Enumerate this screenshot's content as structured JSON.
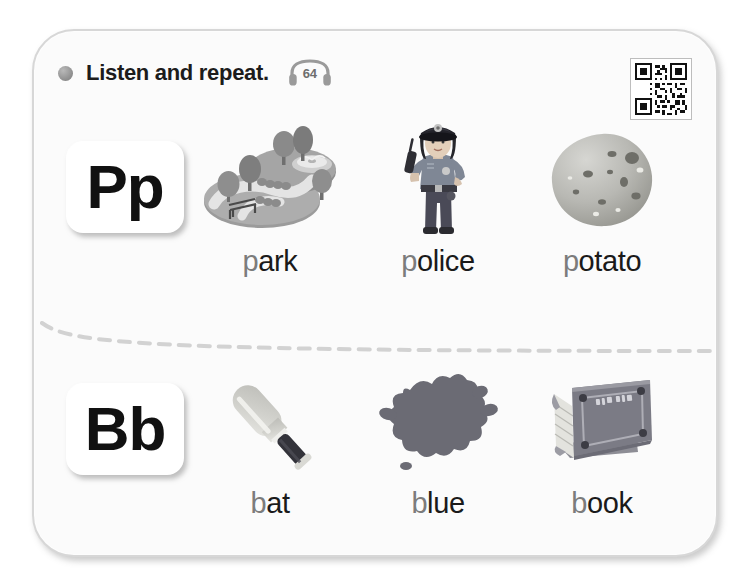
{
  "header": {
    "bullet_icon": "bullet-dot-icon",
    "title": "Listen and repeat.",
    "audio_icon": "headphones-icon",
    "audio_track": "64"
  },
  "qr": {
    "icon": "qr-code-icon"
  },
  "divider": {
    "style": "dashed-curve",
    "color": "#d2d2d2"
  },
  "rows": [
    {
      "letter": "Pp",
      "letter_card_name": "letter-card-pp",
      "items": [
        {
          "word_initial": "p",
          "word_rest": "ark",
          "word": "park",
          "art_icon": "park-illustration"
        },
        {
          "word_initial": "p",
          "word_rest": "olice",
          "word": "police",
          "art_icon": "police-officer-illustration"
        },
        {
          "word_initial": "p",
          "word_rest": "otato",
          "word": "potato",
          "art_icon": "potato-illustration"
        }
      ]
    },
    {
      "letter": "Bb",
      "letter_card_name": "letter-card-bb",
      "items": [
        {
          "word_initial": "b",
          "word_rest": "at",
          "word": "bat",
          "art_icon": "baseball-bat-illustration"
        },
        {
          "word_initial": "b",
          "word_rest": "lue",
          "word": "blue",
          "art_icon": "paint-splat-illustration"
        },
        {
          "word_initial": "b",
          "word_rest": "ook",
          "word": "book",
          "art_icon": "book-illustration"
        }
      ]
    }
  ],
  "colors": {
    "panel_bg": "#fbfbfb",
    "panel_border": "#d7d7d7",
    "text_dark": "#1a1a1a",
    "text_initial": "#7c7c7c",
    "bullet": "#8d8d8d"
  }
}
